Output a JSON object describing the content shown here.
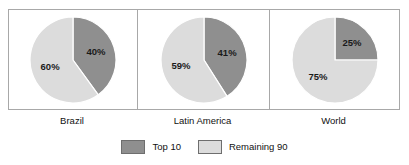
{
  "chart_data": {
    "type": "pie",
    "title": "",
    "subtitle": "",
    "xlabel": "",
    "ylabel": "",
    "grid": false,
    "legend_position": "bottom-center",
    "series_names": [
      "Top 10",
      "Remaining 90"
    ],
    "colors": {
      "top10": "#8f8f8f",
      "remaining90": "#dcdcdc",
      "slice_edge": "#ffffff",
      "frame_border": "#a8a8a8",
      "legend_swatch_border": "#6e6e6e",
      "text": "#111111",
      "background": "#ffffff"
    },
    "charts": [
      {
        "name": "Brazil",
        "label": "Brazil",
        "slices": [
          {
            "name": "Top 10",
            "label": "40%",
            "value": 40
          },
          {
            "name": "Remaining 90",
            "label": "60%",
            "value": 60
          }
        ]
      },
      {
        "name": "Latin America",
        "label": "Latin America",
        "slices": [
          {
            "name": "Top 10",
            "label": "41%",
            "value": 41
          },
          {
            "name": "Remaining 90",
            "label": "59%",
            "value": 59
          }
        ]
      },
      {
        "name": "World",
        "label": "World",
        "slices": [
          {
            "name": "Top 10",
            "label": "25%",
            "value": 25
          },
          {
            "name": "Remaining 90",
            "label": "75%",
            "value": 75
          }
        ]
      }
    ]
  },
  "legend": {
    "entries": [
      {
        "label": "Top 10",
        "color": "#8f8f8f"
      },
      {
        "label": "Remaining 90",
        "color": "#dcdcdc"
      }
    ]
  }
}
